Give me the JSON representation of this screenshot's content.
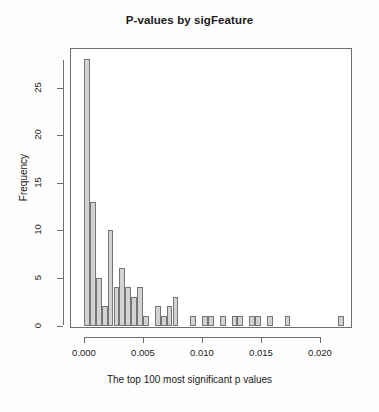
{
  "chart_data": {
    "type": "bar",
    "subtype": "histogram",
    "title": "P-values by sigFeature",
    "xlabel": "The top 100 most significant p values",
    "ylabel": "Frequency",
    "grid": false,
    "legend": null,
    "legend_position": "none",
    "bin_width": 0.0005,
    "bin_start": 0.0,
    "xlim": [
      -0.00055,
      0.02295
    ],
    "ylim": [
      0,
      28
    ],
    "xticks": [
      0.0,
      0.005,
      0.01,
      0.015,
      0.02
    ],
    "xtick_labels": [
      "0.000",
      "0.005",
      "0.010",
      "0.015",
      "0.020"
    ],
    "yticks": [
      0,
      5,
      10,
      15,
      20,
      25
    ],
    "ytick_labels": [
      "0",
      "5",
      "10",
      "15",
      "20",
      "25"
    ],
    "bin_left_edges": [
      0.0,
      0.0005,
      0.001,
      0.0015,
      0.002,
      0.0025,
      0.003,
      0.0035,
      0.004,
      0.0045,
      0.005,
      0.0055,
      0.006,
      0.0065,
      0.007,
      0.0075,
      0.008,
      0.0085,
      0.009,
      0.0095,
      0.01,
      0.0105,
      0.011,
      0.0115,
      0.012,
      0.0125,
      0.013,
      0.0135,
      0.014,
      0.0145,
      0.015,
      0.0155,
      0.016,
      0.0165,
      0.017,
      0.0175,
      0.018,
      0.0185,
      0.019,
      0.0195,
      0.02,
      0.0205,
      0.021,
      0.0215
    ],
    "values": [
      28,
      13,
      5,
      2,
      10,
      4,
      6,
      4,
      3,
      4,
      1,
      0,
      2,
      1,
      2,
      3,
      0,
      0,
      1,
      0,
      1,
      1,
      0,
      1,
      0,
      1,
      1,
      0,
      1,
      1,
      0,
      1,
      0,
      0,
      1,
      0,
      0,
      0,
      0,
      0,
      0,
      0,
      0,
      1
    ],
    "bar_fill_color": "#d3d3d3",
    "bar_border_color": "#757575",
    "axis_color": "#6e6e6e",
    "text_color": "#1a1a1a",
    "background_color": "#ffffff"
  }
}
